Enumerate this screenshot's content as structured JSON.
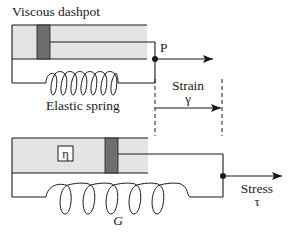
{
  "diagram": {
    "type": "viscoelastic-model",
    "colors": {
      "line": "#1a1a1a",
      "dashpot_fill": "#e4e4e4",
      "piston_fill": "#6e6e6e",
      "background": "#ffffff"
    },
    "top_model": {
      "dashpot_label": "Viscous dashpot",
      "spring_label": "Elastic spring",
      "point_label": "P"
    },
    "strain": {
      "label": "Strain",
      "symbol": "γ"
    },
    "bottom_model": {
      "viscosity_symbol": "η",
      "modulus_symbol": "G"
    },
    "stress": {
      "label": "Stress",
      "symbol": "τ"
    }
  }
}
